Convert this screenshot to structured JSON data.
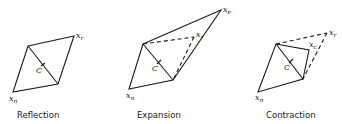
{
  "figures": [
    {
      "id": "reflection",
      "caption": "Reflection",
      "labels": {
        "xr": "x",
        "xr_sub": "r",
        "xn": "x",
        "xn_sub": "n",
        "c": "C"
      }
    },
    {
      "id": "expansion",
      "caption": "Expansion",
      "labels": {
        "xe": "x",
        "xe_sub": "e",
        "xr": "x",
        "xr_sub": "r",
        "xn": "x",
        "xn_sub": "n",
        "c": "C"
      }
    },
    {
      "id": "contraction",
      "caption": "Contraction",
      "labels": {
        "xr": "x",
        "xr_sub": "r",
        "xc": "x",
        "xc_sub": "c",
        "xn": "x",
        "xn_sub": "n",
        "c": "C"
      }
    }
  ]
}
